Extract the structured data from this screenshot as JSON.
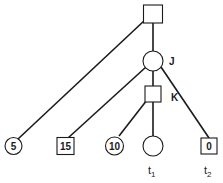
{
  "diagram": {
    "type": "game-tree",
    "nodes": {
      "root": {
        "shape": "square",
        "label": ""
      },
      "J": {
        "shape": "circle",
        "label": "J"
      },
      "K": {
        "shape": "square",
        "label": "K"
      },
      "leaf_5": {
        "shape": "circle",
        "value": "5"
      },
      "leaf_15": {
        "shape": "square",
        "value": "15"
      },
      "leaf_10": {
        "shape": "circle",
        "value": "10"
      },
      "leaf_t1": {
        "shape": "circle",
        "value": ""
      },
      "leaf_0": {
        "shape": "square",
        "value": "0"
      }
    },
    "edges": [
      [
        "root",
        "leaf_5"
      ],
      [
        "root",
        "J"
      ],
      [
        "J",
        "leaf_15"
      ],
      [
        "J",
        "K"
      ],
      [
        "J",
        "leaf_0"
      ],
      [
        "K",
        "leaf_10"
      ],
      [
        "K",
        "leaf_t1"
      ]
    ],
    "terminal_labels": {
      "t1": {
        "base": "t",
        "sub": "1"
      },
      "t2": {
        "base": "t",
        "sub": "2"
      }
    }
  }
}
